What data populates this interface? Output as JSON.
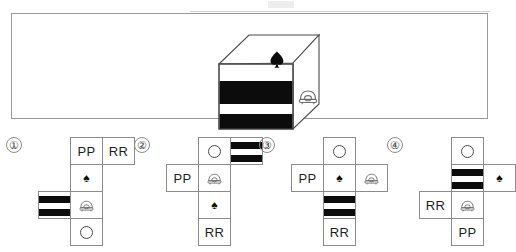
{
  "page": {
    "scan_line_visible": true
  },
  "colors": {
    "ink": "#1a1a1a",
    "stripe_black": "#0c0c0c",
    "rule_gray": "#8c8c8c",
    "panel_border": "#9a9a9a",
    "paper": "#ffffff"
  },
  "question": {
    "cube": {
      "label": "three-dimensional cube",
      "faces": {
        "top": {
          "symbol": "spade",
          "glyph": "♠"
        },
        "front": {
          "symbol": "horizontal-stripes",
          "stripe_count": 2
        },
        "right": {
          "symbol": "telephone"
        }
      }
    }
  },
  "options": [
    {
      "number": "①",
      "name": "option-1",
      "cells": [
        {
          "name": "cell-pp",
          "content": "PP",
          "type": "letters",
          "col": 2,
          "row": 0
        },
        {
          "name": "cell-rr",
          "content": "RR",
          "type": "letters",
          "col": 3,
          "row": 0
        },
        {
          "name": "cell-spade",
          "content": "♠",
          "type": "spade",
          "col": 2,
          "row": 1
        },
        {
          "name": "cell-striped",
          "content": "",
          "type": "striped",
          "col": 1,
          "row": 2
        },
        {
          "name": "cell-phone",
          "content": "",
          "type": "phone",
          "col": 2,
          "row": 2
        },
        {
          "name": "cell-circle",
          "content": "",
          "type": "circle",
          "col": 2,
          "row": 3
        }
      ]
    },
    {
      "number": "②",
      "name": "option-2",
      "cells": [
        {
          "name": "cell-circle",
          "content": "",
          "type": "circle",
          "col": 2,
          "row": 0
        },
        {
          "name": "cell-striped",
          "content": "",
          "type": "striped",
          "col": 3,
          "row": 0
        },
        {
          "name": "cell-pp",
          "content": "PP",
          "type": "letters",
          "col": 1,
          "row": 1
        },
        {
          "name": "cell-phone",
          "content": "",
          "type": "phone",
          "col": 2,
          "row": 1
        },
        {
          "name": "cell-spade",
          "content": "♠",
          "type": "spade",
          "col": 2,
          "row": 2
        },
        {
          "name": "cell-rr",
          "content": "RR",
          "type": "letters",
          "col": 2,
          "row": 3
        }
      ]
    },
    {
      "number": "③",
      "name": "option-3",
      "cells": [
        {
          "name": "cell-circle",
          "content": "",
          "type": "circle",
          "col": 2,
          "row": 0
        },
        {
          "name": "cell-pp",
          "content": "PP",
          "type": "letters",
          "col": 1,
          "row": 1
        },
        {
          "name": "cell-spade",
          "content": "♠",
          "type": "spade",
          "col": 2,
          "row": 1
        },
        {
          "name": "cell-phone",
          "content": "",
          "type": "phone",
          "col": 3,
          "row": 1
        },
        {
          "name": "cell-striped",
          "content": "",
          "type": "striped",
          "col": 2,
          "row": 2
        },
        {
          "name": "cell-rr",
          "content": "RR",
          "type": "letters",
          "col": 2,
          "row": 3
        }
      ]
    },
    {
      "number": "④",
      "name": "option-4",
      "cells": [
        {
          "name": "cell-circle",
          "content": "",
          "type": "circle",
          "col": 2,
          "row": 0
        },
        {
          "name": "cell-striped",
          "content": "",
          "type": "striped",
          "col": 2,
          "row": 1
        },
        {
          "name": "cell-spade",
          "content": "♠",
          "type": "spade",
          "col": 3,
          "row": 1
        },
        {
          "name": "cell-rr",
          "content": "RR",
          "type": "letters",
          "col": 1,
          "row": 2
        },
        {
          "name": "cell-phone",
          "content": "",
          "type": "phone",
          "col": 2,
          "row": 2
        },
        {
          "name": "cell-pp",
          "content": "PP",
          "type": "letters",
          "col": 2,
          "row": 3
        }
      ]
    }
  ]
}
